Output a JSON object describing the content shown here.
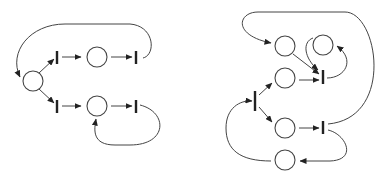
{
  "diagram": {
    "type": "petri-net",
    "colors": {
      "stroke": "#444444",
      "transition": "#222222",
      "background": "#ffffff"
    },
    "nets": [
      {
        "name": "left-net",
        "places": [
          {
            "id": "p0",
            "cx": 33,
            "cy": 81
          },
          {
            "id": "p1",
            "cx": 97,
            "cy": 57
          },
          {
            "id": "p2",
            "cx": 97,
            "cy": 106
          }
        ],
        "transitions": [
          {
            "id": "t0",
            "x": 57,
            "y1": 51,
            "y2": 64
          },
          {
            "id": "t1",
            "x": 136,
            "y1": 51,
            "y2": 64
          },
          {
            "id": "t2",
            "x": 57,
            "y1": 100,
            "y2": 113
          },
          {
            "id": "t3",
            "x": 136,
            "y1": 100,
            "y2": 113
          }
        ]
      },
      {
        "name": "right-net",
        "places": [
          {
            "id": "pa",
            "cx": 285,
            "cy": 46
          },
          {
            "id": "pb",
            "cx": 323,
            "cy": 45
          },
          {
            "id": "pc",
            "cx": 285,
            "cy": 78
          },
          {
            "id": "pd",
            "cx": 285,
            "cy": 128
          },
          {
            "id": "pe",
            "cx": 285,
            "cy": 160
          }
        ],
        "transitions": [
          {
            "id": "ta",
            "x": 323,
            "y1": 70,
            "y2": 84
          },
          {
            "id": "tb",
            "x": 255,
            "y1": 91,
            "y2": 111
          },
          {
            "id": "tc",
            "x": 323,
            "y1": 121,
            "y2": 134
          }
        ]
      }
    ]
  }
}
